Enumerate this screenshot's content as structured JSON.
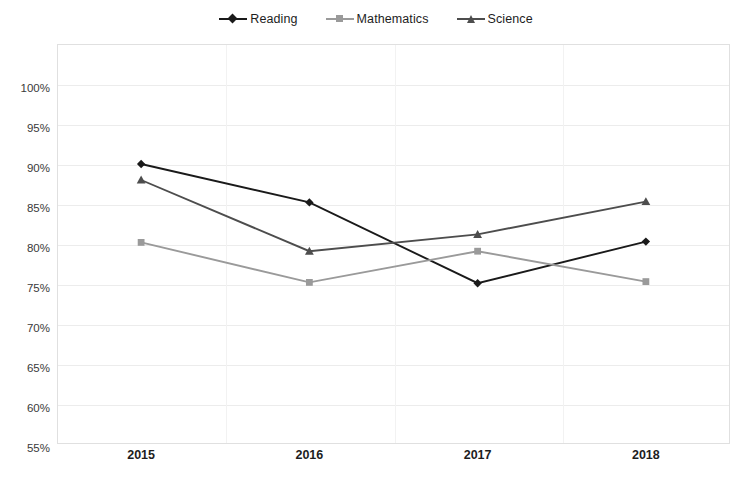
{
  "chart_data": {
    "type": "line",
    "title": "",
    "xlabel": "",
    "ylabel": "",
    "categories": [
      "2015",
      "2016",
      "2017",
      "2018"
    ],
    "ylim": [
      50,
      100
    ],
    "ytick_labels": [
      "100%",
      "95%",
      "90%",
      "85%",
      "80%",
      "75%",
      "70%",
      "65%",
      "60%",
      "55%",
      "50%"
    ],
    "ytick_values": [
      100,
      95,
      90,
      85,
      80,
      75,
      70,
      65,
      60,
      55,
      50
    ],
    "yaxis_format": "percent",
    "grid": "horizontal-and-vertical",
    "legend_position": "top-center",
    "series": [
      {
        "name": "Reading",
        "values": [
          85.0,
          80.2,
          70.1,
          75.3
        ],
        "color": "#1a1a1a",
        "marker": "diamond"
      },
      {
        "name": "Mathematics",
        "values": [
          75.2,
          70.2,
          74.1,
          70.3
        ],
        "color": "#9a9a9a",
        "marker": "square"
      },
      {
        "name": "Science",
        "values": [
          83.0,
          74.1,
          76.2,
          80.3
        ],
        "color": "#4d4d4d",
        "marker": "triangle"
      }
    ]
  },
  "legend": {
    "items": [
      {
        "label": "Reading",
        "icon": "diamond-marker-icon"
      },
      {
        "label": "Mathematics",
        "icon": "square-marker-icon"
      },
      {
        "label": "Science",
        "icon": "triangle-marker-icon"
      }
    ]
  },
  "colors": {
    "reading": "#1a1a1a",
    "mathematics": "#9a9a9a",
    "science": "#4d4d4d",
    "gridline": "#ececec",
    "plot_border": "#e0e0e0",
    "background": "#ffffff",
    "text": "#1d1d1d"
  }
}
